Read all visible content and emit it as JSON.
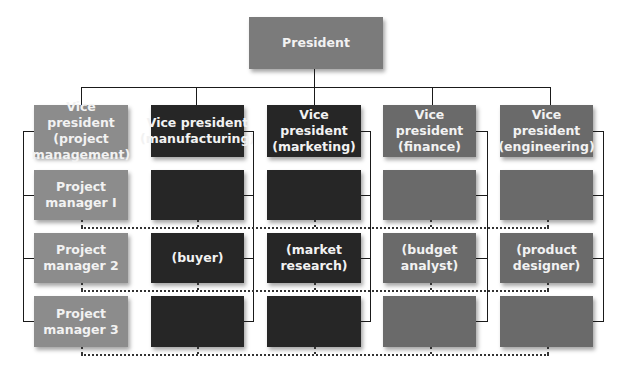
{
  "colors": {
    "president": "#7b7b7b",
    "project_management": "#8c8c8c",
    "manufacturing": "#262626",
    "marketing": "#262626",
    "finance": "#6a6a6a",
    "engineering": "#6a6a6a"
  },
  "president": {
    "label": "President"
  },
  "columns": [
    {
      "id": "project-management",
      "vp": "Vice president (project management)",
      "rows": [
        "Project manager I",
        "Project manager 2",
        "Project manager 3"
      ]
    },
    {
      "id": "manufacturing",
      "vp": "Vice president (manufacturing)",
      "rows": [
        "",
        "(buyer)",
        ""
      ]
    },
    {
      "id": "marketing",
      "vp": "Vice president (marketing)",
      "rows": [
        "",
        "(market research)",
        ""
      ]
    },
    {
      "id": "finance",
      "vp": "Vice president (finance)",
      "rows": [
        "",
        "(budget analyst)",
        ""
      ]
    },
    {
      "id": "engineering",
      "vp": "Vice president (engineering)",
      "rows": [
        "",
        "(product designer)",
        ""
      ]
    }
  ]
}
